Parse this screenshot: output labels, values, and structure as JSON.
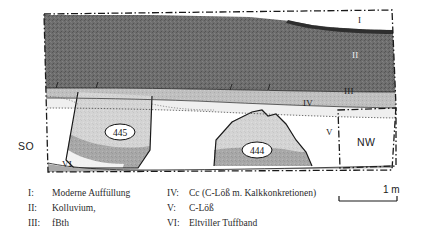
{
  "figure": {
    "type": "geological-cross-section",
    "orientation": {
      "left_label": "SO",
      "right_label": "NW"
    },
    "scale": {
      "label": "1 m",
      "bar_length_m": 1
    },
    "unit_labels": {
      "I": "I",
      "II": "II",
      "III": "III",
      "IV": "IV",
      "V": "V",
      "VI": "VI"
    },
    "features": [
      {
        "id": "feature-445",
        "number": "445"
      },
      {
        "id": "feature-444",
        "number": "444"
      }
    ]
  },
  "legend": {
    "left_column": [
      {
        "key": "I:",
        "text": "Moderne Auffüllung"
      },
      {
        "key": "II:",
        "text": "Kolluvium,"
      },
      {
        "key": "III:",
        "text": "fBth"
      }
    ],
    "right_column": [
      {
        "key": "IV:",
        "text": "Cc (C-Löß m. Kalkkonkretionen)"
      },
      {
        "key": "V:",
        "text": "C-Löß"
      },
      {
        "key": "VI:",
        "text": "Eltviller Tuffband"
      }
    ]
  },
  "colors": {
    "unit_I_fill": "#ffffff",
    "unit_II_fill": "#6b6b6b",
    "unit_III_fill": "#bdbdbd",
    "unit_IV_fill": "#efefef",
    "unit_V_fill": "#ffffff",
    "unit_VI_fill": "#9a9a9a",
    "fill_light_gray": "#d2d2d2",
    "fill_mid_gray": "#a6a6a6",
    "outline": "#1a1a1a"
  }
}
